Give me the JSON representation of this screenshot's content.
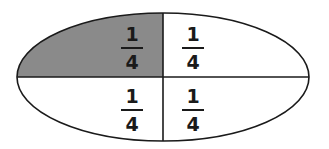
{
  "diagram": {
    "shape": "ellipse",
    "divisions": 4,
    "shaded_count": 1,
    "colors": {
      "shaded": "#8a8a8a",
      "unshaded": "#ffffff",
      "stroke": "#1a1a1a"
    },
    "parts": [
      {
        "position": "top-left",
        "numerator": "1",
        "denominator": "4",
        "shaded": true
      },
      {
        "position": "top-right",
        "numerator": "1",
        "denominator": "4",
        "shaded": false
      },
      {
        "position": "bottom-left",
        "numerator": "1",
        "denominator": "4",
        "shaded": false
      },
      {
        "position": "bottom-right",
        "numerator": "1",
        "denominator": "4",
        "shaded": false
      }
    ]
  }
}
